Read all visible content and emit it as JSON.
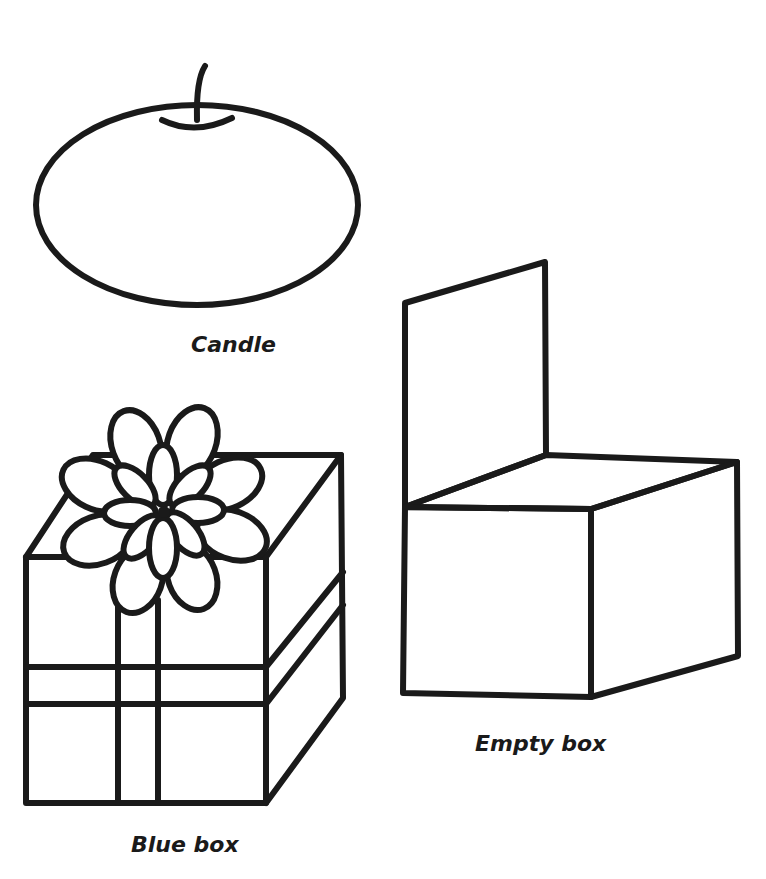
{
  "page": {
    "background": "#ffffff",
    "stroke_color": "#1a1a1a"
  },
  "items": [
    {
      "id": "candle",
      "label": "Candle"
    },
    {
      "id": "blue-box",
      "label": "Blue box"
    },
    {
      "id": "empty-box",
      "label": "Empty box"
    }
  ]
}
